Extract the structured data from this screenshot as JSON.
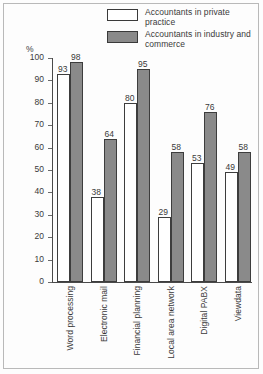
{
  "chart_data": {
    "type": "bar",
    "title": "",
    "xlabel": "",
    "ylabel": "%",
    "ylim": [
      0,
      100
    ],
    "yticks": [
      0,
      10,
      20,
      30,
      40,
      50,
      60,
      70,
      80,
      90,
      100
    ],
    "grid": false,
    "legend_position": "top-right",
    "categories": [
      "Word processing",
      "Electronic mail",
      "Financial planning",
      "Local area network",
      "Digital PABX",
      "Viewdata"
    ],
    "series": [
      {
        "name": "Accountants in private practice",
        "color": "#ffffff",
        "values": [
          93,
          38,
          80,
          29,
          53,
          49
        ]
      },
      {
        "name": "Accountants in industry and commerce",
        "color": "#8a8a8a",
        "values": [
          98,
          64,
          95,
          58,
          76,
          58
        ]
      }
    ]
  },
  "legend": {
    "items": [
      {
        "label": "Accountants in private practice",
        "swatch": "white"
      },
      {
        "label": "Accountants in industry and commerce",
        "swatch": "gray"
      }
    ]
  },
  "axis": {
    "unit_label": "%"
  },
  "colors": {
    "series_private": "#ffffff",
    "series_industry": "#8a8a8a",
    "axis": "#4a4a4a",
    "text": "#3a3a3a",
    "frame": "#b9b9b9"
  }
}
